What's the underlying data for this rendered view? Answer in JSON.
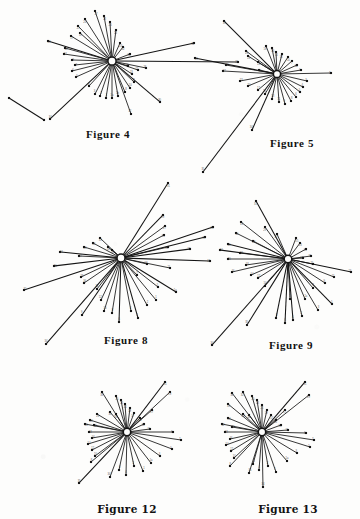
{
  "page": {
    "background_color": "#fdfdfc",
    "ink_color": "#141414",
    "width": 360,
    "height": 519
  },
  "figures": [
    {
      "id": "figure-4",
      "caption": "Figure 4",
      "caption_x": 108,
      "caption_y": 128,
      "hub": {
        "x": 112,
        "y": 61,
        "outer_r": 4.1,
        "inner_r": 2.0
      },
      "extra_segments": [
        {
          "x1": 9,
          "y1": 98,
          "x2": 44,
          "y2": 120
        }
      ],
      "rays": [
        {
          "x": 95,
          "y": 11,
          "label": "27"
        },
        {
          "x": 85,
          "y": 19,
          "label": "24"
        },
        {
          "x": 78,
          "y": 26,
          "label": "21"
        },
        {
          "x": 80,
          "y": 33,
          "label": "19"
        },
        {
          "x": 71,
          "y": 36,
          "label": "17"
        },
        {
          "x": 48,
          "y": 41,
          "label": "33"
        },
        {
          "x": 65,
          "y": 48,
          "label": "14"
        },
        {
          "x": 64,
          "y": 54,
          "label": "12"
        },
        {
          "x": 72,
          "y": 60,
          "label": "9"
        },
        {
          "x": 75,
          "y": 65,
          "label": "7"
        },
        {
          "x": 72,
          "y": 71,
          "label": "6"
        },
        {
          "x": 76,
          "y": 77,
          "label": "5"
        },
        {
          "x": 50,
          "y": 119,
          "label": "34"
        },
        {
          "x": 89,
          "y": 86,
          "label": "4"
        },
        {
          "x": 95,
          "y": 94,
          "label": "3"
        },
        {
          "x": 100,
          "y": 96,
          "label": "2"
        },
        {
          "x": 106,
          "y": 98,
          "label": "1"
        },
        {
          "x": 112,
          "y": 98,
          "label": "1a"
        },
        {
          "x": 118,
          "y": 96,
          "label": "1b"
        },
        {
          "x": 125,
          "y": 92,
          "label": "8"
        },
        {
          "x": 131,
          "y": 114,
          "label": "32"
        },
        {
          "x": 130,
          "y": 88,
          "label": "10"
        },
        {
          "x": 134,
          "y": 82,
          "label": "11"
        },
        {
          "x": 160,
          "y": 102,
          "label": "30"
        },
        {
          "x": 132,
          "y": 74,
          "label": "13"
        },
        {
          "x": 138,
          "y": 70,
          "label": "15"
        },
        {
          "x": 128,
          "y": 66,
          "label": "16"
        },
        {
          "x": 146,
          "y": 68,
          "label": "18"
        },
        {
          "x": 238,
          "y": 62,
          "label": "35"
        },
        {
          "x": 194,
          "y": 43,
          "label": "31"
        },
        {
          "x": 130,
          "y": 54,
          "label": "20"
        },
        {
          "x": 123,
          "y": 47,
          "label": "22"
        },
        {
          "x": 120,
          "y": 43,
          "label": "23"
        },
        {
          "x": 116,
          "y": 30,
          "label": "25"
        },
        {
          "x": 110,
          "y": 22,
          "label": "26"
        },
        {
          "x": 104,
          "y": 16,
          "label": "28"
        }
      ]
    },
    {
      "id": "figure-5",
      "caption": "Figure 5",
      "caption_x": 292,
      "caption_y": 137,
      "hub": {
        "x": 277,
        "y": 74,
        "outer_r": 3.6,
        "inner_r": 1.7
      },
      "extra_segments": [],
      "rays": [
        {
          "x": 224,
          "y": 21,
          "label": "31"
        },
        {
          "x": 246,
          "y": 51,
          "label": "26"
        },
        {
          "x": 248,
          "y": 56,
          "label": "24"
        },
        {
          "x": 195,
          "y": 58,
          "label": "33"
        },
        {
          "x": 258,
          "y": 62,
          "label": "22"
        },
        {
          "x": 226,
          "y": 65,
          "label": "29"
        },
        {
          "x": 223,
          "y": 71,
          "label": "27"
        },
        {
          "x": 259,
          "y": 70,
          "label": "19"
        },
        {
          "x": 240,
          "y": 81,
          "label": "23"
        },
        {
          "x": 248,
          "y": 86,
          "label": "20"
        },
        {
          "x": 258,
          "y": 90,
          "label": "17"
        },
        {
          "x": 265,
          "y": 94,
          "label": "15"
        },
        {
          "x": 203,
          "y": 172,
          "label": "35"
        },
        {
          "x": 252,
          "y": 130,
          "label": "34"
        },
        {
          "x": 272,
          "y": 99,
          "label": "13"
        },
        {
          "x": 279,
          "y": 102,
          "label": "11"
        },
        {
          "x": 285,
          "y": 104,
          "label": "9"
        },
        {
          "x": 291,
          "y": 101,
          "label": "8"
        },
        {
          "x": 296,
          "y": 97,
          "label": "6"
        },
        {
          "x": 300,
          "y": 92,
          "label": "5"
        },
        {
          "x": 303,
          "y": 87,
          "label": "4"
        },
        {
          "x": 307,
          "y": 81,
          "label": "3"
        },
        {
          "x": 331,
          "y": 73,
          "label": "2"
        },
        {
          "x": 301,
          "y": 70,
          "label": "1"
        },
        {
          "x": 297,
          "y": 65,
          "label": "1a"
        },
        {
          "x": 292,
          "y": 61,
          "label": "7"
        },
        {
          "x": 288,
          "y": 57,
          "label": "10"
        },
        {
          "x": 282,
          "y": 54,
          "label": "12"
        },
        {
          "x": 276,
          "y": 52,
          "label": "14"
        },
        {
          "x": 272,
          "y": 48,
          "label": "16"
        },
        {
          "x": 266,
          "y": 46,
          "label": "18"
        }
      ]
    },
    {
      "id": "figure-8",
      "caption": "Figure 8",
      "caption_x": 126,
      "caption_y": 334,
      "hub": {
        "x": 121,
        "y": 258,
        "outer_r": 4.0,
        "inner_r": 2.0
      },
      "extra_segments": [],
      "rays": [
        {
          "x": 168,
          "y": 183,
          "label": "31"
        },
        {
          "x": 163,
          "y": 215,
          "label": "29"
        },
        {
          "x": 165,
          "y": 226,
          "label": "27"
        },
        {
          "x": 164,
          "y": 235,
          "label": "25"
        },
        {
          "x": 100,
          "y": 238,
          "label": "33"
        },
        {
          "x": 93,
          "y": 243,
          "label": "32"
        },
        {
          "x": 108,
          "y": 247,
          "label": "30"
        },
        {
          "x": 112,
          "y": 250,
          "label": "28"
        },
        {
          "x": 84,
          "y": 247,
          "label": "26"
        },
        {
          "x": 60,
          "y": 252,
          "label": "24"
        },
        {
          "x": 79,
          "y": 256,
          "label": "22"
        },
        {
          "x": 54,
          "y": 266,
          "label": "20"
        },
        {
          "x": 24,
          "y": 290,
          "label": "35"
        },
        {
          "x": 81,
          "y": 277,
          "label": "18"
        },
        {
          "x": 84,
          "y": 283,
          "label": "16"
        },
        {
          "x": 97,
          "y": 289,
          "label": "14"
        },
        {
          "x": 46,
          "y": 344,
          "label": "34"
        },
        {
          "x": 101,
          "y": 300,
          "label": "12"
        },
        {
          "x": 104,
          "y": 311,
          "label": "10"
        },
        {
          "x": 112,
          "y": 313,
          "label": "8"
        },
        {
          "x": 82,
          "y": 315,
          "label": "9"
        },
        {
          "x": 119,
          "y": 322,
          "label": "6"
        },
        {
          "x": 131,
          "y": 311,
          "label": "4"
        },
        {
          "x": 138,
          "y": 318,
          "label": "3"
        },
        {
          "x": 147,
          "y": 305,
          "label": "2"
        },
        {
          "x": 156,
          "y": 300,
          "label": "1"
        },
        {
          "x": 176,
          "y": 292,
          "label": "1a"
        },
        {
          "x": 158,
          "y": 287,
          "label": "5"
        },
        {
          "x": 137,
          "y": 275,
          "label": "7"
        },
        {
          "x": 170,
          "y": 268,
          "label": "11"
        },
        {
          "x": 147,
          "y": 264,
          "label": "13"
        },
        {
          "x": 210,
          "y": 261,
          "label": "15"
        },
        {
          "x": 190,
          "y": 249,
          "label": "17"
        },
        {
          "x": 205,
          "y": 237,
          "label": "19"
        },
        {
          "x": 168,
          "y": 247,
          "label": "21"
        },
        {
          "x": 213,
          "y": 227,
          "label": "23"
        }
      ]
    },
    {
      "id": "figure-9",
      "caption": "Figure 9",
      "caption_x": 291,
      "caption_y": 339,
      "hub": {
        "x": 288,
        "y": 259,
        "outer_r": 3.8,
        "inner_r": 1.9
      },
      "extra_segments": [],
      "rays": [
        {
          "x": 256,
          "y": 201,
          "label": "31"
        },
        {
          "x": 265,
          "y": 227,
          "label": "29"
        },
        {
          "x": 277,
          "y": 234,
          "label": "27"
        },
        {
          "x": 241,
          "y": 222,
          "label": "33"
        },
        {
          "x": 236,
          "y": 233,
          "label": "30"
        },
        {
          "x": 253,
          "y": 241,
          "label": "28"
        },
        {
          "x": 228,
          "y": 244,
          "label": "26"
        },
        {
          "x": 220,
          "y": 250,
          "label": "24"
        },
        {
          "x": 240,
          "y": 253,
          "label": "22"
        },
        {
          "x": 228,
          "y": 259,
          "label": "20"
        },
        {
          "x": 246,
          "y": 265,
          "label": "18"
        },
        {
          "x": 232,
          "y": 272,
          "label": "16"
        },
        {
          "x": 251,
          "y": 275,
          "label": "14"
        },
        {
          "x": 258,
          "y": 278,
          "label": "12"
        },
        {
          "x": 265,
          "y": 286,
          "label": "10"
        },
        {
          "x": 247,
          "y": 325,
          "label": "35"
        },
        {
          "x": 212,
          "y": 345,
          "label": "34"
        },
        {
          "x": 276,
          "y": 318,
          "label": "8"
        },
        {
          "x": 285,
          "y": 323,
          "label": "6"
        },
        {
          "x": 293,
          "y": 320,
          "label": "4"
        },
        {
          "x": 302,
          "y": 316,
          "label": "2"
        },
        {
          "x": 290,
          "y": 299,
          "label": "1"
        },
        {
          "x": 305,
          "y": 299,
          "label": "1a"
        },
        {
          "x": 318,
          "y": 310,
          "label": "3"
        },
        {
          "x": 332,
          "y": 304,
          "label": "5"
        },
        {
          "x": 313,
          "y": 288,
          "label": "7"
        },
        {
          "x": 325,
          "y": 283,
          "label": "9"
        },
        {
          "x": 334,
          "y": 277,
          "label": "11"
        },
        {
          "x": 351,
          "y": 272,
          "label": "13"
        },
        {
          "x": 313,
          "y": 264,
          "label": "15"
        },
        {
          "x": 303,
          "y": 258,
          "label": "17"
        },
        {
          "x": 311,
          "y": 256,
          "label": "19"
        },
        {
          "x": 306,
          "y": 249,
          "label": "21"
        },
        {
          "x": 300,
          "y": 243,
          "label": "23"
        },
        {
          "x": 296,
          "y": 238,
          "label": "25"
        }
      ]
    },
    {
      "id": "figure-12",
      "caption": "Figure 12",
      "caption_x": 127,
      "caption_y": 503,
      "hub": {
        "x": 127,
        "y": 432,
        "outer_r": 3.7,
        "inner_r": 1.8
      },
      "extra_segments": [],
      "rays": [
        {
          "x": 165,
          "y": 382,
          "label": "31"
        },
        {
          "x": 170,
          "y": 392,
          "label": "29"
        },
        {
          "x": 102,
          "y": 392,
          "label": "33"
        },
        {
          "x": 152,
          "y": 410,
          "label": "27"
        },
        {
          "x": 110,
          "y": 412,
          "label": "30"
        },
        {
          "x": 116,
          "y": 414,
          "label": "28"
        },
        {
          "x": 97,
          "y": 414,
          "label": "26"
        },
        {
          "x": 90,
          "y": 420,
          "label": "24"
        },
        {
          "x": 94,
          "y": 425,
          "label": "22"
        },
        {
          "x": 85,
          "y": 424,
          "label": "20"
        },
        {
          "x": 89,
          "y": 432,
          "label": "18"
        },
        {
          "x": 92,
          "y": 438,
          "label": "16"
        },
        {
          "x": 88,
          "y": 444,
          "label": "14"
        },
        {
          "x": 92,
          "y": 450,
          "label": "12"
        },
        {
          "x": 95,
          "y": 456,
          "label": "10"
        },
        {
          "x": 91,
          "y": 462,
          "label": "8"
        },
        {
          "x": 79,
          "y": 483,
          "label": "35"
        },
        {
          "x": 110,
          "y": 477,
          "label": "34"
        },
        {
          "x": 119,
          "y": 470,
          "label": "6"
        },
        {
          "x": 126,
          "y": 475,
          "label": "4"
        },
        {
          "x": 134,
          "y": 466,
          "label": "2"
        },
        {
          "x": 143,
          "y": 471,
          "label": "1"
        },
        {
          "x": 151,
          "y": 463,
          "label": "1a"
        },
        {
          "x": 160,
          "y": 456,
          "label": "3"
        },
        {
          "x": 172,
          "y": 449,
          "label": "5"
        },
        {
          "x": 181,
          "y": 440,
          "label": "7"
        },
        {
          "x": 173,
          "y": 432,
          "label": "9"
        },
        {
          "x": 150,
          "y": 429,
          "label": "11"
        },
        {
          "x": 144,
          "y": 424,
          "label": "13"
        },
        {
          "x": 140,
          "y": 418,
          "label": "15"
        },
        {
          "x": 134,
          "y": 413,
          "label": "17"
        },
        {
          "x": 130,
          "y": 408,
          "label": "19"
        },
        {
          "x": 125,
          "y": 404,
          "label": "21"
        },
        {
          "x": 121,
          "y": 400,
          "label": "23"
        },
        {
          "x": 116,
          "y": 396,
          "label": "25"
        }
      ]
    },
    {
      "id": "figure-13",
      "caption": "Figure 13",
      "caption_x": 288,
      "caption_y": 503,
      "hub": {
        "x": 262,
        "y": 432,
        "outer_r": 3.7,
        "inner_r": 1.8
      },
      "extra_segments": [],
      "rays": [
        {
          "x": 305,
          "y": 382,
          "label": "31"
        },
        {
          "x": 309,
          "y": 395,
          "label": "29"
        },
        {
          "x": 232,
          "y": 393,
          "label": "33"
        },
        {
          "x": 243,
          "y": 392,
          "label": "32"
        },
        {
          "x": 228,
          "y": 404,
          "label": "30"
        },
        {
          "x": 285,
          "y": 410,
          "label": "27"
        },
        {
          "x": 243,
          "y": 414,
          "label": "28"
        },
        {
          "x": 249,
          "y": 415,
          "label": "26"
        },
        {
          "x": 228,
          "y": 418,
          "label": "24"
        },
        {
          "x": 222,
          "y": 424,
          "label": "22"
        },
        {
          "x": 232,
          "y": 427,
          "label": "20"
        },
        {
          "x": 225,
          "y": 432,
          "label": "18"
        },
        {
          "x": 230,
          "y": 439,
          "label": "16"
        },
        {
          "x": 226,
          "y": 445,
          "label": "14"
        },
        {
          "x": 231,
          "y": 451,
          "label": "12"
        },
        {
          "x": 234,
          "y": 458,
          "label": "10"
        },
        {
          "x": 230,
          "y": 466,
          "label": "8"
        },
        {
          "x": 249,
          "y": 473,
          "label": "35"
        },
        {
          "x": 263,
          "y": 487,
          "label": "34"
        },
        {
          "x": 253,
          "y": 464,
          "label": "6"
        },
        {
          "x": 259,
          "y": 470,
          "label": "4"
        },
        {
          "x": 268,
          "y": 466,
          "label": "2"
        },
        {
          "x": 276,
          "y": 472,
          "label": "1"
        },
        {
          "x": 287,
          "y": 461,
          "label": "1a"
        },
        {
          "x": 297,
          "y": 453,
          "label": "3"
        },
        {
          "x": 310,
          "y": 447,
          "label": "5"
        },
        {
          "x": 314,
          "y": 440,
          "label": "7"
        },
        {
          "x": 306,
          "y": 433,
          "label": "9"
        },
        {
          "x": 288,
          "y": 430,
          "label": "11"
        },
        {
          "x": 281,
          "y": 425,
          "label": "13"
        },
        {
          "x": 276,
          "y": 420,
          "label": "15"
        },
        {
          "x": 271,
          "y": 415,
          "label": "17"
        },
        {
          "x": 267,
          "y": 410,
          "label": "19"
        },
        {
          "x": 262,
          "y": 405,
          "label": "21"
        },
        {
          "x": 257,
          "y": 400,
          "label": "23"
        },
        {
          "x": 252,
          "y": 396,
          "label": "25"
        }
      ]
    }
  ]
}
